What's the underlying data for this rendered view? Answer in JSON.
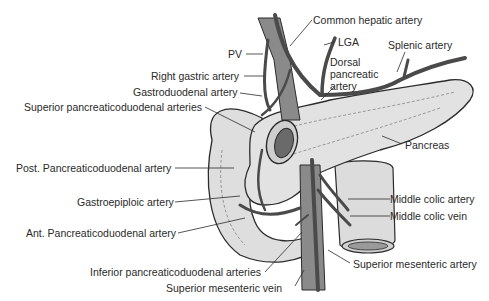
{
  "diagram": {
    "labels": {
      "common_hepatic_artery": "Common hepatic artery",
      "pv": "PV",
      "lga": "LGA",
      "splenic_artery": "Splenic artery",
      "dorsal_pancreatic_artery_l1": "Dorsal",
      "dorsal_pancreatic_artery_l2": "pancreatic",
      "dorsal_pancreatic_artery_l3": "artery",
      "right_gastric_artery": "Right gastric artery",
      "gastroduodenal_artery": "Gastroduodenal artery",
      "superior_pancreaticoduodenal_arteries": "Superior pancreaticoduodenal arteries",
      "pancreas": "Pancreas",
      "post_pancreaticoduodenal_artery": "Post. Pancreaticoduodenal artery",
      "middle_colic_artery": "Middle colic artery",
      "gastroepiploic_artery": "Gastroepiploic artery",
      "middle_colic_vein": "Middle colic vein",
      "ant_pancreaticoduodenal_artery": "Ant. Pancreaticoduodenal artery",
      "inferior_pancreaticoduodenal_arteries": "Inferior pancreaticoduodenal arteries",
      "superior_mesenteric_artery": "Superior mesenteric artery",
      "superior_mesenteric_vein": "Superior mesenteric vein"
    },
    "colors": {
      "outline": "#2b2b2b",
      "organ_fill": "#dcdcdc",
      "vessel_dark": "#4a4a4a",
      "vein_fill": "#8a8a8a",
      "text": "#2a2a2a"
    }
  }
}
